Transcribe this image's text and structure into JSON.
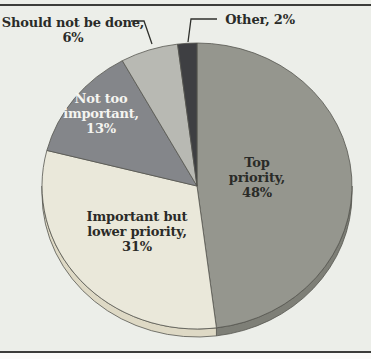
{
  "page": {
    "background": "#eceee9",
    "footer_background": "#fbfbf9",
    "rule_color": "#3c3d3a",
    "top_rule_y": 4,
    "bottom_rule_y": 351
  },
  "chart_data": {
    "type": "pie",
    "style": "3d",
    "title": "",
    "xlabel": "",
    "ylabel": "",
    "legend_position": "none",
    "direction": "clockwise",
    "start_angle_deg": 0,
    "geometry": {
      "cx": 197,
      "cy": 186,
      "rx": 155,
      "ry": 143,
      "depth": 8
    },
    "stroke_color": "#55564f",
    "leader_color": "#2f302c",
    "categories": [
      "Top priority",
      "Important but lower priority",
      "Not too important",
      "Should not be done",
      "Other"
    ],
    "values": [
      48,
      31,
      13,
      6,
      2
    ],
    "slices": [
      {
        "label": "Top priority",
        "value": 48,
        "display": "Top\npriority,\n48%",
        "color": "#95968e",
        "depth_color": "#7e7f77",
        "label_color": "#2a2b28",
        "label_x": 257,
        "label_y": 177,
        "label_placement": "inside"
      },
      {
        "label": "Important but lower priority",
        "value": 31,
        "display": "Important but\nlower priority,\n31%",
        "color": "#eae8da",
        "depth_color": "#ded9c5",
        "label_color": "#2a2b28",
        "label_x": 137,
        "label_y": 231,
        "label_placement": "inside"
      },
      {
        "label": "Not too important",
        "value": 13,
        "display": "Not too\nimportant,\n13%",
        "color": "#84868a",
        "label_color": "#f4f4f0",
        "label_x": 101,
        "label_y": 113,
        "label_placement": "inside"
      },
      {
        "label": "Should not be done",
        "value": 6,
        "display": "Should not be done,\n6%",
        "color": "#b8b9b3",
        "label_color": "#2a2b28",
        "label_x": 73,
        "label_y": 30,
        "label_placement": "outside",
        "leader": [
          [
            131,
            21
          ],
          [
            144,
            21
          ],
          [
            152,
            44
          ]
        ]
      },
      {
        "label": "Other",
        "value": 2,
        "display": "Other, 2%",
        "color": "#3e3f42",
        "label_color": "#2a2b28",
        "label_x": 260,
        "label_y": 19,
        "label_placement": "outside",
        "leader": [
          [
            217,
            19
          ],
          [
            191,
            19
          ],
          [
            188,
            42
          ]
        ]
      }
    ]
  }
}
